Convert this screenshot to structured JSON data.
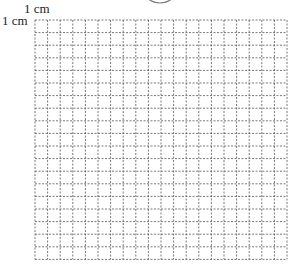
{
  "diagram": {
    "type": "square grid",
    "scale_label_horizontal": "1 cm",
    "scale_label_vertical": "1 cm",
    "columns": 20,
    "rows": 19,
    "cell_size_px": 12.6,
    "origin_px": [
      35,
      20
    ],
    "line_style": "dashed",
    "line_color": "#555555",
    "top_shape": "partial ellipse (cropped)"
  }
}
